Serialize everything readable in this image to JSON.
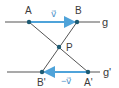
{
  "diagram": {
    "colors": {
      "line": "#555555",
      "vector": "#4fa3d9",
      "point": "#1d5b73",
      "label": "#3a3a3a",
      "vector_label": "#4a90c8"
    },
    "lines": [
      {
        "name": "g",
        "label": "g",
        "y": 22
      },
      {
        "name": "g_prime",
        "label": "g'",
        "y": 72
      }
    ],
    "points": [
      {
        "name": "A",
        "label": "A",
        "x": 29,
        "y": 22
      },
      {
        "name": "B",
        "label": "B",
        "x": 77,
        "y": 22
      },
      {
        "name": "P",
        "label": "P",
        "x": 59,
        "y": 47
      },
      {
        "name": "B_prime",
        "label": "B'",
        "x": 42,
        "y": 72
      },
      {
        "name": "A_prime",
        "label": "A'",
        "x": 88,
        "y": 72
      }
    ],
    "vectors": [
      {
        "name": "v",
        "label": "v⃗",
        "from": "A",
        "to": "B"
      },
      {
        "name": "minus_v",
        "label": "−v⃗",
        "from": "A'",
        "to": "B'"
      }
    ],
    "segments": [
      {
        "from": "A",
        "to": "A'"
      },
      {
        "from": "B",
        "to": "B'"
      }
    ]
  }
}
